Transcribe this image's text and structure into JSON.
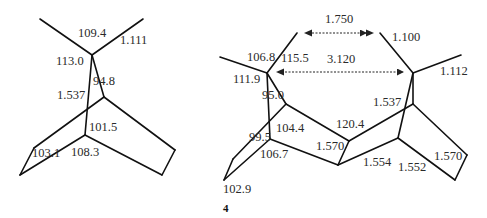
{
  "figure": {
    "compound_label": "4",
    "left_structure": {
      "labels": [
        {
          "id": "angle-top",
          "text": "109.4",
          "x": 78,
          "y": 33
        },
        {
          "id": "bond-ch",
          "text": "1.111",
          "x": 120,
          "y": 40
        },
        {
          "id": "angle-left",
          "text": "113.0",
          "x": 56,
          "y": 55
        },
        {
          "id": "angle-bridge",
          "text": "94.8",
          "x": 92,
          "y": 75
        },
        {
          "id": "bond-cc",
          "text": "1.537",
          "x": 57,
          "y": 89
        },
        {
          "id": "angle-101",
          "text": "101.5",
          "x": 89,
          "y": 120
        },
        {
          "id": "angle-103",
          "text": "103.1",
          "x": 32,
          "y": 146
        },
        {
          "id": "angle-108",
          "text": "108.3",
          "x": 71,
          "y": 146
        }
      ]
    },
    "right_structure": {
      "labels": [
        {
          "id": "dist-hh",
          "text": "1.750",
          "x": 325,
          "y": 12
        },
        {
          "id": "bond-ch-right",
          "text": "1.100",
          "x": 392,
          "y": 30
        },
        {
          "id": "angle-106",
          "text": "106.8",
          "x": 247,
          "y": 50
        },
        {
          "id": "angle-115",
          "text": "115.5",
          "x": 281,
          "y": 51
        },
        {
          "id": "dist-cc",
          "text": "3.120",
          "x": 326,
          "y": 53
        },
        {
          "id": "bond-ch-methyl",
          "text": "1.112",
          "x": 440,
          "y": 64
        },
        {
          "id": "angle-111",
          "text": "111.9",
          "x": 233,
          "y": 73
        },
        {
          "id": "angle-95",
          "text": "95.0",
          "x": 263,
          "y": 88
        },
        {
          "id": "bond-1537-right",
          "text": "1.537",
          "x": 374,
          "y": 96
        },
        {
          "id": "angle-104",
          "text": "104.4",
          "x": 275,
          "y": 122
        },
        {
          "id": "angle-120",
          "text": "120.4",
          "x": 336,
          "y": 117
        },
        {
          "id": "angle-99",
          "text": "99.5",
          "x": 249,
          "y": 131
        },
        {
          "id": "bond-1570-mid",
          "text": "1.570",
          "x": 315,
          "y": 139
        },
        {
          "id": "angle-106-7",
          "text": "106.7",
          "x": 260,
          "y": 147
        },
        {
          "id": "bond-1554",
          "text": "1.554",
          "x": 363,
          "y": 154
        },
        {
          "id": "bond-1552",
          "text": "1.552",
          "x": 398,
          "y": 159
        },
        {
          "id": "bond-1570-right",
          "text": "1.570",
          "x": 434,
          "y": 149
        },
        {
          "id": "angle-102",
          "text": "102.9",
          "x": 223,
          "y": 182
        }
      ]
    },
    "colors": {
      "bond": "#111111",
      "text": "#2a2a2a",
      "arrow": "#222222"
    }
  }
}
